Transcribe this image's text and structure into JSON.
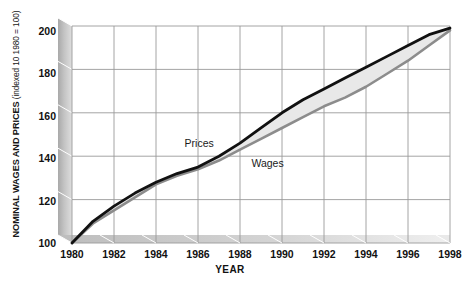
{
  "chart_data": {
    "type": "line",
    "title": "",
    "subtitle": "",
    "xlabel": "YEAR",
    "ylabel": "NOMINAL WAGES AND PRICES",
    "ylabel_note": "(indexed 10 1980 = 100)",
    "xlim": [
      1980,
      1998
    ],
    "ylim": [
      100,
      200
    ],
    "grid": true,
    "legend_position": "inline-annotations",
    "xticks": [
      1980,
      1982,
      1984,
      1986,
      1988,
      1990,
      1992,
      1994,
      1996,
      1998
    ],
    "yticks": [
      100,
      120,
      140,
      160,
      180,
      200
    ],
    "x": [
      1980,
      1981,
      1982,
      1983,
      1984,
      1985,
      1986,
      1987,
      1988,
      1989,
      1990,
      1991,
      1992,
      1993,
      1994,
      1995,
      1996,
      1997,
      1998
    ],
    "series": [
      {
        "name": "Prices",
        "color": "#111111",
        "values": [
          100,
          110,
          117,
          123,
          128,
          132,
          135,
          140,
          146,
          153,
          160,
          166,
          171,
          176,
          181,
          186,
          191,
          196,
          199
        ]
      },
      {
        "name": "Wages",
        "color": "#8c8c8c",
        "values": [
          100,
          109,
          115,
          121,
          127,
          131,
          134,
          138,
          143,
          148,
          153,
          158,
          163,
          167,
          172,
          178,
          184,
          191,
          198
        ]
      }
    ],
    "band_fill": "#e8e8e8",
    "annotations": [
      {
        "text": "Prices",
        "x": 1986.6,
        "y": 146
      },
      {
        "text": "Wages",
        "x": 1989.4,
        "y": 137
      }
    ]
  },
  "axis": {
    "y_title_main": "NOMINAL WAGES AND PRICES",
    "y_title_sub": " (indexed 10 1980 = 100)",
    "x_title": "YEAR",
    "y_tick_labels": [
      "200",
      "180",
      "160",
      "140",
      "120",
      "100"
    ],
    "x_tick_labels": [
      "1980",
      "1982",
      "1984",
      "1986",
      "1988",
      "1990",
      "1992",
      "1994",
      "1996",
      "1998"
    ]
  },
  "annotations": {
    "prices_label": "Prices",
    "wages_label": "Wages"
  },
  "colors": {
    "prices_line": "#111111",
    "wages_line": "#8c8c8c",
    "band_fill": "#e8e8e8",
    "gridline": "#9a9a9a",
    "wall_light": "#dcdcdc",
    "wall_dark": "#9e9e9e",
    "floor": "#cfcfcf",
    "text": "#111111"
  }
}
